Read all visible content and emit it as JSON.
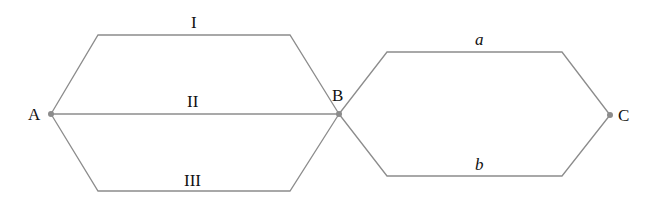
{
  "diagram": {
    "type": "circuit-paths",
    "nodes": [
      {
        "id": "A",
        "label": "A",
        "x": 51,
        "y": 114
      },
      {
        "id": "B",
        "label": "B",
        "x": 339,
        "y": 114
      },
      {
        "id": "C",
        "label": "C",
        "x": 610,
        "y": 115
      }
    ],
    "paths": [
      {
        "id": "I",
        "label": "I",
        "from": "A",
        "to": "B",
        "position": "top"
      },
      {
        "id": "II",
        "label": "II",
        "from": "A",
        "to": "B",
        "position": "middle"
      },
      {
        "id": "III",
        "label": "III",
        "from": "A",
        "to": "B",
        "position": "bottom"
      },
      {
        "id": "a",
        "label": "a",
        "from": "B",
        "to": "C",
        "position": "top"
      },
      {
        "id": "b",
        "label": "b",
        "from": "B",
        "to": "C",
        "position": "bottom"
      }
    ],
    "colors": {
      "edge": "#8c8c8c",
      "text": "#111111"
    }
  }
}
